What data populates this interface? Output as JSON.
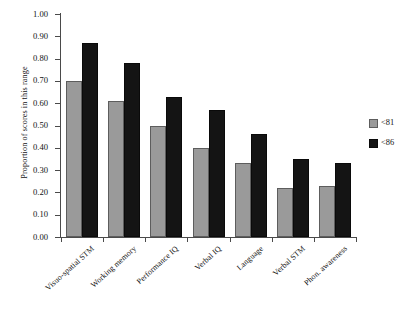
{
  "chart_data": {
    "type": "bar",
    "title": "",
    "xlabel": "",
    "ylabel": "Proportion of scores in this range",
    "ylim": [
      0,
      1.0
    ],
    "ytick_step": 0.1,
    "ytick_labels": [
      "1.00",
      "0.90",
      "0.80",
      "0.70",
      "0.60",
      "0.50",
      "0.40",
      "0.30",
      "0.20",
      "0.10",
      "0.00"
    ],
    "ytick_values": [
      1.0,
      0.9,
      0.8,
      0.7,
      0.6,
      0.5,
      0.4,
      0.3,
      0.2,
      0.1,
      0.0
    ],
    "grid": false,
    "legend_position": "right",
    "categories": [
      "Visuo-spatial STM",
      "Working memory",
      "Performance IQ",
      "Verbal IQ",
      "Language",
      "Verbal STM",
      "Phon. awareness"
    ],
    "series": [
      {
        "name": "<81",
        "color": "#9a9a9a",
        "values": [
          0.7,
          0.61,
          0.5,
          0.4,
          0.33,
          0.22,
          0.23
        ]
      },
      {
        "name": "<86",
        "color": "#141414",
        "values": [
          0.87,
          0.78,
          0.63,
          0.57,
          0.46,
          0.35,
          0.33
        ]
      }
    ]
  },
  "legend": {
    "items": [
      {
        "label": "<81"
      },
      {
        "label": "<86"
      }
    ]
  }
}
